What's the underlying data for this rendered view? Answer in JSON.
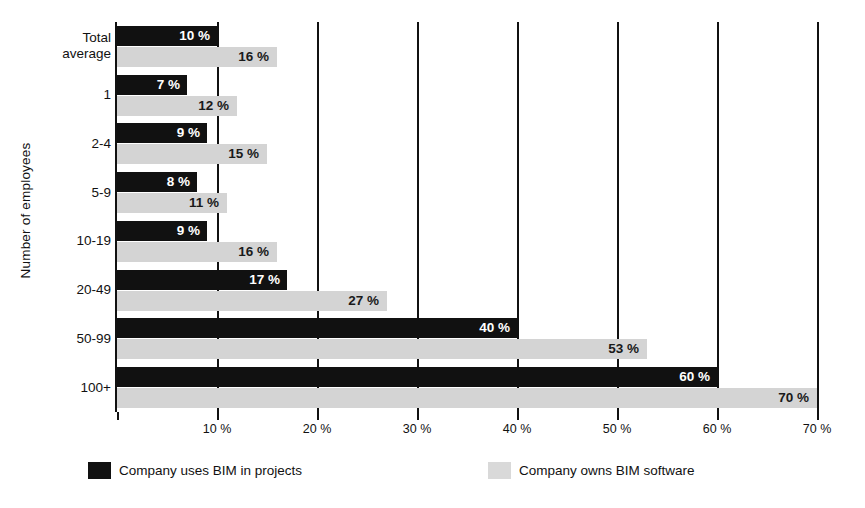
{
  "chart_data": {
    "type": "bar",
    "orientation": "horizontal",
    "title": "",
    "xlabel": "",
    "ylabel": "Number of employees",
    "xlim": [
      0,
      70
    ],
    "grid": true,
    "grid_axis": "x",
    "legend_position": "bottom",
    "categories": [
      "Total average",
      "1",
      "2-4",
      "5-9",
      "10-19",
      "20-49",
      "50-99",
      "100+"
    ],
    "category_lines": [
      [
        "Total",
        "average"
      ],
      [
        "1"
      ],
      [
        "2-4"
      ],
      [
        "5-9"
      ],
      [
        "10-19"
      ],
      [
        "20-49"
      ],
      [
        "50-99"
      ],
      [
        "100+"
      ]
    ],
    "series": [
      {
        "name": "Company uses BIM in projects",
        "color": "#111111",
        "label_color": "#ffffff",
        "label_placement": "inside-end",
        "values": [
          10,
          7,
          9,
          8,
          9,
          17,
          40,
          60
        ],
        "value_labels": [
          "10 %",
          "7 %",
          "9 %",
          "8 %",
          "9 %",
          "17 %",
          "40 %",
          "60 %"
        ]
      },
      {
        "name": "Company owns BIM software",
        "color": "#d4d4d4",
        "label_color": "#1a1a1a",
        "label_placement": "inside-end",
        "values": [
          16,
          12,
          15,
          11,
          16,
          27,
          53,
          70
        ],
        "value_labels": [
          "16 %",
          "12 %",
          "15 %",
          "11 %",
          "16 %",
          "27 %",
          "53 %",
          "70 %"
        ]
      }
    ],
    "xticks": [
      0,
      10,
      20,
      30,
      40,
      50,
      60,
      70
    ],
    "xtick_labels": [
      "",
      "10 %",
      "20 %",
      "30 %",
      "40 %",
      "50 %",
      "60 %",
      "70 %"
    ]
  },
  "legend": {
    "items": [
      {
        "label": "Company uses BIM in projects",
        "swatch": "dark"
      },
      {
        "label": "Company owns BIM software",
        "swatch": "light"
      }
    ]
  }
}
